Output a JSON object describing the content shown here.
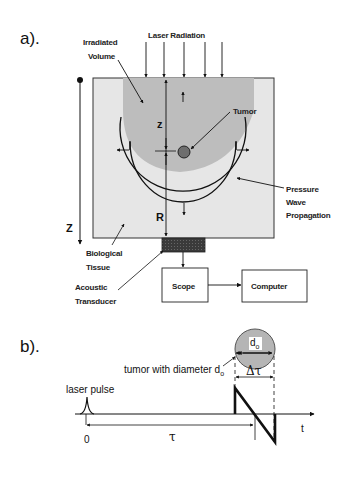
{
  "panel_a": {
    "label": "a).",
    "laser_radiation": "Laser Radiation",
    "irradiated_volume_line1": "Irradiated",
    "irradiated_volume_line2": "Volume",
    "tumor": "Tumor",
    "pressure_line1": "Pressure",
    "pressure_line2": "Wave",
    "pressure_line3": "Propagation",
    "depth_axis": "Z",
    "depth_small": "z",
    "radius": "R",
    "tissue_line1": "Biological",
    "tissue_line2": "Tissue",
    "transducer_line1": "Acoustic",
    "transducer_line2": "Transducer",
    "scope": "Scope",
    "computer": "Computer"
  },
  "panel_b": {
    "label": "b).",
    "tumor_diameter_label": "tumor with diameter d",
    "tumor_diameter_sub": "o",
    "tumor_circle_label": "d",
    "tumor_circle_sub": "o",
    "delta_tau": "Δτ",
    "laser_pulse": "laser pulse",
    "origin": "0",
    "tau": "τ",
    "time_axis": "t"
  },
  "colors": {
    "tissue": "#e6e6e6",
    "irradiated": "#bdbdbd",
    "tumor": "#6e6e6e",
    "transducer": "#3a3a3a",
    "tumor_circle_b": "#b5b5b5",
    "line": "#111111"
  }
}
